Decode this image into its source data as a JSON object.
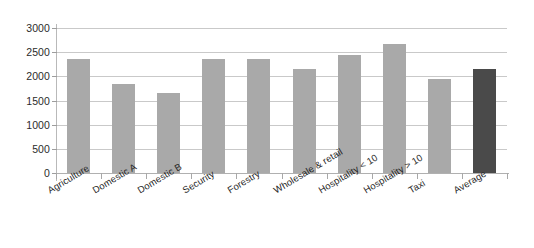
{
  "chart_data": {
    "type": "bar",
    "title": "",
    "subtitle": "",
    "xlabel": "",
    "ylabel": "",
    "categories": [
      "Agriculture",
      "Domestic A",
      "Domestic B",
      "Security",
      "Forestry",
      "Wholesale & retail",
      "Hospitality < 10",
      "Hospitality > 10",
      "Taxi",
      "Average"
    ],
    "values": [
      2350,
      1850,
      1650,
      2350,
      2350,
      2150,
      2450,
      2670,
      1950,
      2150
    ],
    "ylim": [
      0,
      3000
    ],
    "ytick_labels": [
      "3000",
      "2500",
      "2000",
      "1500",
      "1000",
      "500",
      "0"
    ],
    "ytick_values": [
      3000,
      2500,
      2000,
      1500,
      1000,
      500,
      0
    ],
    "grid": true,
    "legend": "none",
    "bar_color": "#a9a9a9",
    "highlight_color": "#4a4a4a",
    "highlight_category": "Average",
    "gridline_color": "#c9c9c9",
    "axis_color": "#b0b0b0",
    "background_color": "#ffffff",
    "label_rotation_deg": -31
  }
}
